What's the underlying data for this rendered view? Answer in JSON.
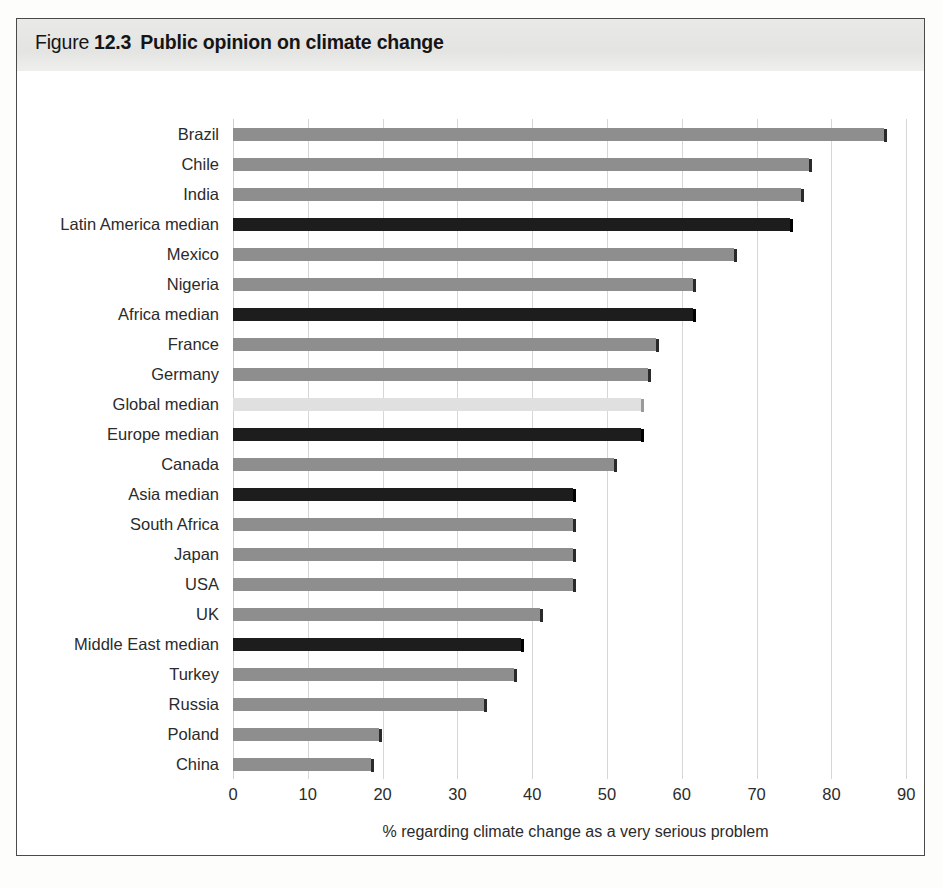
{
  "figure": {
    "label_word": "Figure",
    "number": "12.3",
    "title": "Public opinion on climate change"
  },
  "chart_data": {
    "type": "bar",
    "orientation": "horizontal",
    "title": "Public opinion on climate change",
    "xlabel": "% regarding climate change as a very serious problem",
    "ylabel": "",
    "xlim": [
      0,
      90
    ],
    "xticks": [
      "0",
      "10",
      "20",
      "30",
      "40",
      "50",
      "60",
      "70",
      "80",
      "90"
    ],
    "grid": true,
    "legend": "none",
    "categories": [
      "Brazil",
      "Chile",
      "India",
      "Latin America median",
      "Mexico",
      "Nigeria",
      "Africa median",
      "France",
      "Germany",
      "Global median",
      "Europe median",
      "Canada",
      "Asia median",
      "South Africa",
      "Japan",
      "USA",
      "UK",
      "Middle East median",
      "Turkey",
      "Russia",
      "Poland",
      "China"
    ],
    "values": [
      87,
      77,
      76,
      74.5,
      67,
      61.5,
      61.5,
      56.5,
      55.5,
      54.5,
      54.5,
      51,
      45.5,
      45.5,
      45.5,
      45.5,
      41,
      38.5,
      37.5,
      33.5,
      19.5,
      18.5
    ],
    "bar_styles": [
      "country",
      "country",
      "country",
      "median",
      "country",
      "country",
      "median",
      "country",
      "country",
      "global",
      "median",
      "country",
      "median",
      "country",
      "country",
      "country",
      "country",
      "median",
      "country",
      "country",
      "country",
      "country"
    ]
  },
  "colors": {
    "country_bar": "#8e8e8e",
    "median_bar": "#1d1d1d",
    "global_bar": "#e0e0e0",
    "gridline": "#d7d7d5",
    "title_band": "#e6e6e4",
    "frame": "#4a4a4a"
  }
}
